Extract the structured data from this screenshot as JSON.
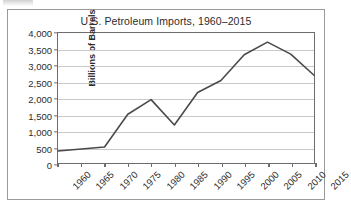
{
  "figure": {
    "title": "U.S. Petroleum Imports, 1960–2015",
    "line_color": "#4a4a4a",
    "grid_color": "#c9c9c9",
    "axis_color": "#6d6d6d",
    "frame_color": "#9a9a9a"
  },
  "chart_data": {
    "type": "line",
    "title": "U.S. Petroleum Imports, 1960–2015",
    "xlabel": "",
    "ylabel": "Billions of Barrels",
    "x": [
      1960,
      1965,
      1970,
      1975,
      1980,
      1985,
      1990,
      1995,
      2000,
      2005,
      2010,
      2015
    ],
    "values": [
      370,
      430,
      490,
      1500,
      1950,
      1170,
      2170,
      2540,
      3330,
      3720,
      3350,
      2700
    ],
    "series": [
      {
        "name": "U.S. Petroleum Imports",
        "values": [
          370,
          430,
          490,
          1500,
          1950,
          1170,
          2170,
          2540,
          3330,
          3720,
          3350,
          2700
        ]
      }
    ],
    "xtick_labels": [
      "1960",
      "1965",
      "1970",
      "1975",
      "1980",
      "1985",
      "1990",
      "1995",
      "2000",
      "2005",
      "2010",
      "2015"
    ],
    "ytick_labels": [
      "0",
      "500",
      "1,000",
      "1,500",
      "2,000",
      "2,500",
      "3,000",
      "3,500",
      "4,000"
    ],
    "yticks": [
      0,
      500,
      1000,
      1500,
      2000,
      2500,
      3000,
      3500,
      4000
    ],
    "ylim": [
      0,
      4000
    ],
    "xlim": [
      1960,
      2015
    ],
    "grid": "horizontal",
    "legend": "none",
    "markers": "none"
  }
}
